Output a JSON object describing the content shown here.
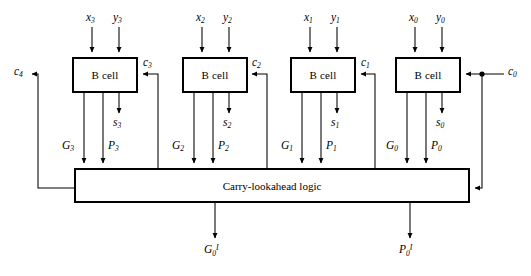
{
  "diagram": {
    "cells": [
      {
        "label": "B cell",
        "x_input": "x",
        "x_index": "3",
        "y_input": "y",
        "y_index": "3",
        "sum_output": "s",
        "sum_index": "3",
        "generate_output": "G",
        "generate_index": "3",
        "propagate_output": "P",
        "propagate_index": "3",
        "carry_input": "c",
        "carry_index": "3"
      },
      {
        "label": "B cell",
        "x_input": "x",
        "x_index": "2",
        "y_input": "y",
        "y_index": "2",
        "sum_output": "s",
        "sum_index": "2",
        "generate_output": "G",
        "generate_index": "2",
        "propagate_output": "P",
        "propagate_index": "2",
        "carry_input": "c",
        "carry_index": "2"
      },
      {
        "label": "B cell",
        "x_input": "x",
        "x_index": "1",
        "y_input": "y",
        "y_index": "1",
        "sum_output": "s",
        "sum_index": "1",
        "generate_output": "G",
        "generate_index": "1",
        "propagate_output": "P",
        "propagate_index": "1",
        "carry_input": "c",
        "carry_index": "1"
      },
      {
        "label": "B cell",
        "x_input": "x",
        "x_index": "0",
        "y_input": "y",
        "y_index": "0",
        "sum_output": "s",
        "sum_index": "0",
        "generate_output": "G",
        "generate_index": "0",
        "propagate_output": "P",
        "propagate_index": "0",
        "carry_input": "c",
        "carry_index": "0"
      }
    ],
    "logic_block": {
      "label": "Carry-lookahead logic"
    },
    "carry_out": {
      "label": "c",
      "index": "4"
    },
    "carry_in": {
      "label": "c",
      "index": "0"
    },
    "group_generate": {
      "label": "G",
      "index": "0",
      "superscript": "I"
    },
    "group_propagate": {
      "label": "P",
      "index": "0",
      "superscript": "I"
    },
    "colors": {
      "stroke": "#000000",
      "background": "#ffffff"
    }
  }
}
